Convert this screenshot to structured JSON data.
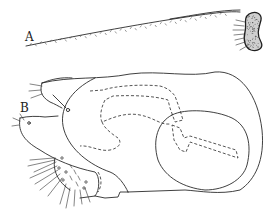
{
  "figure": {
    "type": "scientific line illustration",
    "panels": [
      {
        "label": "A",
        "subject": "antenna with long tapering setose flagellum and stippled basal segment"
      },
      {
        "label": "B",
        "subject": "lateral view of body part with setae, dashed internal structures and large circular outline"
      }
    ]
  },
  "colors": {
    "ink": "#2a2a2a",
    "background": "#ffffff"
  }
}
